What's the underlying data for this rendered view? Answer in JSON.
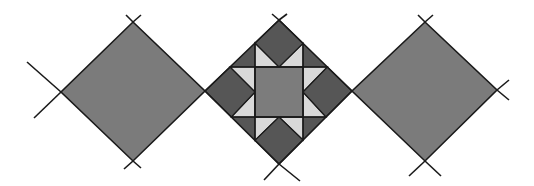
{
  "figure": {
    "description": "Three quilt blocks set on point: two plain diamonds flanking a pieced star block",
    "width": 534,
    "height": 186
  },
  "colors": {
    "background": "#ffffff",
    "plain_block": "#7b7b7b",
    "dark_patch": "#565656",
    "light_patch": "#d9d9d9",
    "center_square": "#7c7c7c",
    "line": "#1a1a1a"
  },
  "blocks": [
    {
      "name": "left-plain-diamond",
      "top": [
        133,
        22
      ],
      "right": [
        205,
        91
      ],
      "bottom": [
        133,
        161
      ],
      "left": [
        61,
        92
      ]
    },
    {
      "name": "center-star-block",
      "top": [
        279,
        20
      ],
      "right": [
        352,
        91
      ],
      "bottom": [
        279,
        164
      ],
      "left": [
        205,
        91
      ],
      "center_square": {
        "x1": 255,
        "y1": 67,
        "x2": 303,
        "y2": 117
      }
    },
    {
      "name": "right-plain-diamond",
      "top": [
        425,
        22
      ],
      "right": [
        497,
        90
      ],
      "bottom": [
        425,
        161
      ],
      "left": [
        352,
        91
      ]
    }
  ],
  "guide_lines": [
    {
      "from": [
        27,
        62
      ],
      "to": [
        61,
        92
      ]
    },
    {
      "from": [
        34,
        118
      ],
      "to": [
        61,
        92
      ]
    },
    {
      "from": [
        126,
        15
      ],
      "to": [
        133,
        22
      ]
    },
    {
      "from": [
        141,
        15
      ],
      "to": [
        133,
        22
      ]
    },
    {
      "from": [
        133,
        161
      ],
      "to": [
        124,
        169
      ]
    },
    {
      "from": [
        133,
        161
      ],
      "to": [
        141,
        168
      ]
    },
    {
      "from": [
        272,
        14
      ],
      "to": [
        279,
        20
      ]
    },
    {
      "from": [
        287,
        14
      ],
      "to": [
        279,
        20
      ]
    },
    {
      "from": [
        279,
        164
      ],
      "to": [
        264,
        180
      ]
    },
    {
      "from": [
        279,
        164
      ],
      "to": [
        300,
        181
      ]
    },
    {
      "from": [
        418,
        15
      ],
      "to": [
        425,
        22
      ]
    },
    {
      "from": [
        433,
        15
      ],
      "to": [
        425,
        22
      ]
    },
    {
      "from": [
        425,
        161
      ],
      "to": [
        409,
        176
      ]
    },
    {
      "from": [
        425,
        161
      ],
      "to": [
        441,
        176
      ]
    },
    {
      "from": [
        497,
        90
      ],
      "to": [
        509,
        80
      ]
    },
    {
      "from": [
        497,
        90
      ],
      "to": [
        509,
        100
      ]
    }
  ]
}
